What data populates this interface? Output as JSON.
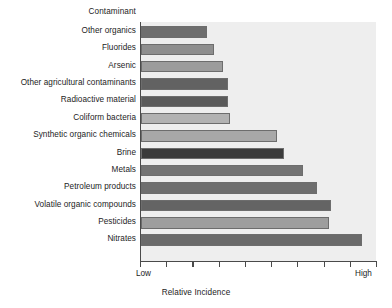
{
  "chart_data": {
    "type": "bar",
    "orientation": "horizontal",
    "title": "",
    "xlabel": "Relative Incidence",
    "ylabel": "Contaminant",
    "x_tick_labels": [
      "Low",
      "High"
    ],
    "x_tick_count": 10,
    "grid": false,
    "legend": null,
    "xlim": [
      0,
      100
    ],
    "categories": [
      "Other organics",
      "Fluorides",
      "Arsenic",
      "Other agricultural contaminants",
      "Radioactive material",
      "Coliform bacteria",
      "Synthetic organic chemicals",
      "Brine",
      "Metals",
      "Petroleum products",
      "Volatile organic compounds",
      "Pesticides",
      "Nitrates"
    ],
    "values": [
      28,
      31,
      35,
      37,
      37,
      38,
      58,
      61,
      69,
      75,
      81,
      80,
      94
    ],
    "bar_colors": [
      "#6e6e6e",
      "#8e8e8e",
      "#9c9c9c",
      "#626262",
      "#5a5a5a",
      "#b2b2b2",
      "#a8a8a8",
      "#3b3b3b",
      "#737373",
      "#6e6e6e",
      "#646464",
      "#9e9e9e",
      "#6a6a6a"
    ]
  },
  "plot": {
    "background_color": "#eeeeee",
    "axis_color": "#4a4a4a",
    "bar_border_color": "#6d6d6d"
  }
}
